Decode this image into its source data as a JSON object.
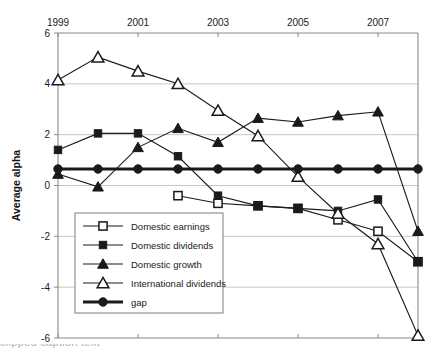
{
  "chart_data": {
    "type": "line",
    "title": "",
    "xlabel": "",
    "ylabel": "Average alpha",
    "xlim": [
      1999,
      2008
    ],
    "ylim": [
      -6,
      6
    ],
    "yticks": [
      6,
      4,
      2,
      0,
      -2,
      -4,
      -6
    ],
    "xticks": [
      1999,
      2001,
      2003,
      2005,
      2007
    ],
    "xtick_labels": [
      "1999",
      "2001",
      "2003",
      "2005",
      "2007"
    ],
    "ytick_labels": [
      "6",
      "4",
      "2",
      "0",
      "-2",
      "-4",
      "-6"
    ],
    "grid": "horizontal",
    "xaxis_position": "top",
    "legend_position": "lower-left-inside",
    "x": [
      1999,
      2000,
      2001,
      2002,
      2003,
      2004,
      2005,
      2006,
      2007,
      2008
    ],
    "series": [
      {
        "name": "Domestic earnings",
        "marker": "open-square",
        "x": [
          2002,
          2003,
          2004,
          2005,
          2006,
          2007,
          2008
        ],
        "values": [
          -0.4,
          -0.7,
          -0.8,
          -0.9,
          -1.35,
          -1.8,
          -3.0
        ]
      },
      {
        "name": "Domestic dividends",
        "marker": "filled-square",
        "x": [
          1999,
          2000,
          2001,
          2002,
          2003,
          2004,
          2005,
          2006,
          2007,
          2008
        ],
        "values": [
          1.4,
          2.05,
          2.05,
          1.15,
          -0.4,
          -0.8,
          -0.9,
          -1.0,
          -0.55,
          -3.0
        ]
      },
      {
        "name": "Domestic growth",
        "marker": "filled-triangle",
        "x": [
          1999,
          2000,
          2001,
          2002,
          2003,
          2004,
          2005,
          2006,
          2007,
          2008
        ],
        "values": [
          0.45,
          -0.05,
          1.5,
          2.25,
          1.7,
          2.65,
          2.5,
          2.75,
          2.9,
          -1.8
        ]
      },
      {
        "name": "International dividends",
        "marker": "open-triangle",
        "x": [
          1999,
          2000,
          2001,
          2002,
          2003,
          2004,
          2005,
          2006,
          2007,
          2008
        ],
        "values": [
          4.15,
          5.05,
          4.5,
          4.0,
          2.95,
          1.95,
          0.35,
          -1.1,
          -2.3,
          -5.9
        ]
      },
      {
        "name": "gap",
        "marker": "filled-circle",
        "x": [
          1999,
          2000,
          2001,
          2002,
          2003,
          2004,
          2005,
          2006,
          2007,
          2008
        ],
        "values": [
          0.65,
          0.65,
          0.65,
          0.65,
          0.65,
          0.65,
          0.65,
          0.65,
          0.65,
          0.65
        ]
      }
    ]
  },
  "axis": {
    "ylabel": "Average alpha",
    "xticks": [
      "1999",
      "2001",
      "2003",
      "2005",
      "2007"
    ],
    "yticks": [
      "6",
      "4",
      "2",
      "0",
      "-2",
      "-4",
      "-6"
    ]
  },
  "legend": {
    "items": [
      {
        "label": "Domestic earnings",
        "marker": "open-square"
      },
      {
        "label": "Domestic dividends",
        "marker": "filled-square"
      },
      {
        "label": "Domestic growth",
        "marker": "filled-triangle"
      },
      {
        "label": "International dividends",
        "marker": "open-triangle"
      },
      {
        "label": "gap",
        "marker": "filled-circle"
      }
    ]
  },
  "footer": {
    "text": "clipped caption text"
  },
  "colors": {
    "ink": "#1a1a1a",
    "grid": "#b9b9b9",
    "axis": "#8a8a8a"
  }
}
